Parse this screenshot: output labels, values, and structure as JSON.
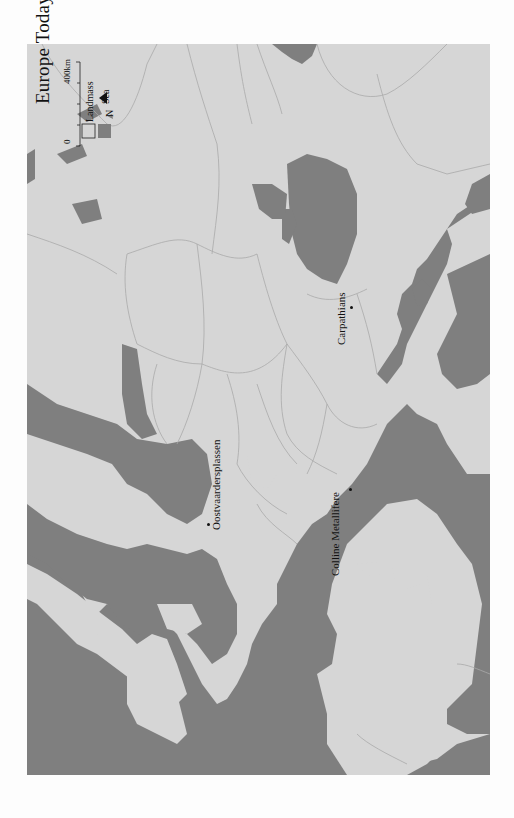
{
  "map": {
    "title": "Europe Today",
    "orientation": "rotated 90° counter-clockwise (north points right)",
    "colors": {
      "landmass": "#d6d6d6",
      "sea": "#7f7f7f",
      "border": "#a9a9a9",
      "page": "#fdfdfd",
      "text": "#111111"
    },
    "scale_bar": {
      "start_label": "0",
      "end_label": "400km"
    },
    "legend": {
      "items": [
        {
          "label": "Landmass",
          "swatch": "#ffffff00"
        },
        {
          "label": "Sea",
          "swatch": "#7f7f7f"
        }
      ]
    },
    "north_arrow": {
      "label": "N"
    },
    "places": [
      {
        "name": "Oostvaardersplassen"
      },
      {
        "name": "Carpathians"
      },
      {
        "name": "Colline Metallifere"
      }
    ]
  }
}
